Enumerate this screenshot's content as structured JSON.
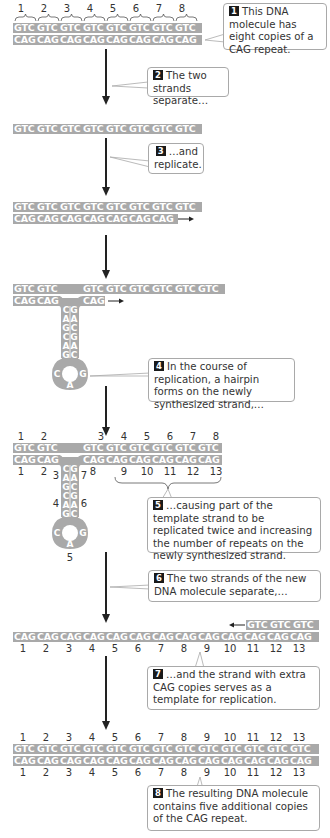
{
  "colors": {
    "strand_fill": "#a9a9a9",
    "strand_text": "#ffffff",
    "badge_fill": "#1a1a1a",
    "arrow": "#222222",
    "callout_border": "#a9a9a9"
  },
  "step1": {
    "repeat_numbers": [
      "1",
      "2",
      "3",
      "4",
      "5",
      "6",
      "7",
      "8"
    ],
    "top_strand": [
      "GTC",
      "GTC",
      "GTC",
      "GTC",
      "GTC",
      "GTC",
      "GTC",
      "GTC"
    ],
    "bottom_strand": [
      "CAG",
      "CAG",
      "CAG",
      "CAG",
      "CAG",
      "CAG",
      "CAG",
      "CAG"
    ],
    "callout": {
      "badge": "1",
      "text": "This DNA molecule has eight copies of a CAG repeat."
    }
  },
  "step2": {
    "callout": {
      "badge": "2",
      "text": "The two strands separate…"
    },
    "single_strand": [
      "GTC",
      "GTC",
      "GTC",
      "GTC",
      "GTC",
      "GTC",
      "GTC",
      "GTC"
    ]
  },
  "step3": {
    "callout": {
      "badge": "3",
      "text": "…and replicate."
    },
    "top_strand": [
      "GTC",
      "GTC",
      "GTC",
      "GTC",
      "GTC",
      "GTC",
      "GTC",
      "GTC"
    ],
    "bottom_strand": [
      "CAG",
      "CAG",
      "CAG",
      "CAG",
      "CAG",
      "CAG",
      "CAG"
    ]
  },
  "step4": {
    "top_left": [
      "GTC",
      "GTC"
    ],
    "top_right": [
      "GTC",
      "GTC",
      "GTC",
      "GTC",
      "GTC",
      "GTC"
    ],
    "bottom_left": [
      "CAG",
      "CAG"
    ],
    "bottom_right": [
      "CAG"
    ],
    "hairpin_left": [
      "C",
      "A",
      "G",
      "C",
      "A",
      "G"
    ],
    "hairpin_right": [
      "G",
      "A",
      "C",
      "G",
      "A",
      "C"
    ],
    "loop": [
      "C",
      "A",
      "G"
    ],
    "callout": {
      "badge": "4",
      "text": "In the course of replication, a hairpin forms on the newly synthesized strand,…"
    }
  },
  "step5": {
    "top_numbers": [
      "1",
      "2",
      "3",
      "4",
      "5",
      "6",
      "7",
      "8"
    ],
    "top_left": [
      "GTC",
      "GTC"
    ],
    "top_right": [
      "GTC",
      "GTC",
      "GTC",
      "GTC",
      "GTC",
      "GTC"
    ],
    "bottom_left": [
      "CAG",
      "CAG"
    ],
    "bottom_right": [
      "CAG",
      "CAG",
      "CAG",
      "CAG",
      "CAG",
      "CAG"
    ],
    "bottom_numbers_left": [
      "1",
      "2"
    ],
    "bottom_numbers_right": [
      "8",
      "9",
      "10",
      "11",
      "12",
      "13"
    ],
    "hairpin_numbers": [
      "3",
      "4",
      "5",
      "6",
      "7"
    ],
    "callout": {
      "badge": "5",
      "text": "…causing part of the template strand to be replicated twice and increasing the number of repeats on the newly synthesized strand."
    }
  },
  "step6": {
    "callout": {
      "badge": "6",
      "text": "The two strands of the new DNA molecule separate,…"
    },
    "new_top": [
      "GTC",
      "GTC",
      "GTC"
    ],
    "long_strand": [
      "CAG",
      "CAG",
      "CAG",
      "CAG",
      "CAG",
      "CAG",
      "CAG",
      "CAG",
      "CAG",
      "CAG",
      "CAG",
      "CAG",
      "CAG"
    ],
    "numbers": [
      "1",
      "2",
      "3",
      "4",
      "5",
      "6",
      "7",
      "8",
      "9",
      "10",
      "11",
      "12",
      "13"
    ]
  },
  "step7": {
    "callout": {
      "badge": "7",
      "text": "…and the strand with extra CAG copies serves as a template for replication."
    }
  },
  "step8": {
    "top_numbers": [
      "1",
      "2",
      "3",
      "4",
      "5",
      "6",
      "7",
      "8",
      "9",
      "10",
      "11",
      "12",
      "13"
    ],
    "top_strand": [
      "GTC",
      "GTC",
      "GTC",
      "GTC",
      "GTC",
      "GTC",
      "GTC",
      "GTC",
      "GTC",
      "GTC",
      "GTC",
      "GTC",
      "GTC"
    ],
    "bottom_strand": [
      "CAG",
      "CAG",
      "CAG",
      "CAG",
      "CAG",
      "CAG",
      "CAG",
      "CAG",
      "CAG",
      "CAG",
      "CAG",
      "CAG",
      "CAG"
    ],
    "bottom_numbers": [
      "1",
      "2",
      "3",
      "4",
      "5",
      "6",
      "7",
      "8",
      "9",
      "10",
      "11",
      "12",
      "13"
    ],
    "callout": {
      "badge": "8",
      "text": "The resulting DNA molecule contains five additional copies of the CAG repeat."
    }
  }
}
